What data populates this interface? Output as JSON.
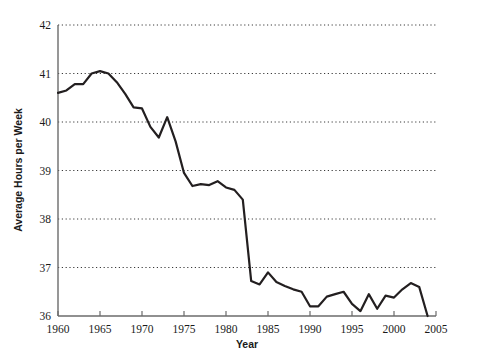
{
  "chart_data": {
    "type": "line",
    "title": "",
    "xlabel": "Year",
    "ylabel": "Average Hours per Week",
    "xlim": [
      1960,
      2005
    ],
    "ylim": [
      36,
      42
    ],
    "xticks": [
      1960,
      1965,
      1970,
      1975,
      1980,
      1985,
      1990,
      1995,
      2000,
      2005
    ],
    "yticks": [
      36,
      37,
      38,
      39,
      40,
      41,
      42
    ],
    "grid": "horizontal-dotted",
    "legend": "none",
    "line_color": "#231f20",
    "x": [
      1960,
      1961,
      1962,
      1963,
      1964,
      1965,
      1966,
      1967,
      1968,
      1969,
      1970,
      1971,
      1972,
      1973,
      1974,
      1975,
      1976,
      1977,
      1978,
      1979,
      1980,
      1981,
      1982,
      1983,
      1984,
      1985,
      1986,
      1987,
      1988,
      1989,
      1990,
      1991,
      1992,
      1993,
      1994,
      1995,
      1996,
      1997,
      1998,
      1999,
      2000,
      2001,
      2002,
      2003,
      2004
    ],
    "values": [
      40.6,
      40.65,
      40.78,
      40.78,
      41.0,
      41.05,
      41.0,
      40.82,
      40.58,
      40.3,
      40.28,
      39.9,
      39.68,
      40.1,
      39.6,
      38.95,
      38.68,
      38.72,
      38.7,
      38.78,
      38.65,
      38.6,
      38.4,
      36.72,
      36.65,
      36.9,
      36.7,
      36.62,
      36.55,
      36.5,
      36.2,
      36.2,
      36.4,
      36.45,
      36.5,
      36.25,
      36.1,
      36.45,
      36.15,
      36.42,
      36.38,
      36.55,
      36.68,
      36.6,
      36.0
    ]
  },
  "axis": {
    "y_title": "Average Hours per Week",
    "x_title": "Year",
    "y_tick_labels": [
      "42",
      "41",
      "40",
      "39",
      "38",
      "37",
      "36"
    ],
    "x_tick_labels": [
      "1960",
      "1965",
      "1970",
      "1975",
      "1980",
      "1985",
      "1990",
      "1995",
      "2000",
      "2005"
    ]
  }
}
